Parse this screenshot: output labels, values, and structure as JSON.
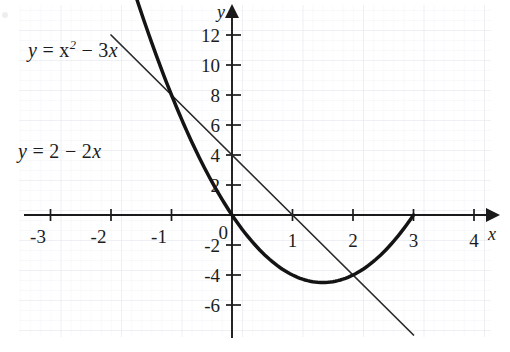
{
  "figure": {
    "kind": "cartesian-graph",
    "background": "#ffffff",
    "grid_color": "#e9ebf0",
    "grid_minor_color": "#f2f4f7",
    "ink_color": "#1a1a1a"
  },
  "axes": {
    "x_axis_label": "x",
    "y_axis_label": "y",
    "origin_label": "0",
    "x_ticks": [
      "-3",
      "-2",
      "-1",
      "1",
      "2",
      "3",
      "4"
    ],
    "y_ticks": [
      "12",
      "10",
      "8",
      "6",
      "4",
      "2",
      "-2",
      "-4",
      "-6"
    ],
    "x_range": [
      -3.7,
      4.3
    ],
    "y_range": [
      -7.0,
      13.0
    ],
    "x_unit_px": 60.5,
    "y_unit_px": 30.0,
    "origin_px": [
      232,
      215
    ]
  },
  "labels": {
    "parabola_prefix": "y",
    "parabola_eq": " = x",
    "parabola_sup": "2",
    "parabola_tail": " − 3",
    "parabola_var": "x",
    "line_prefix": "y",
    "line_eq": " = 2 − 2",
    "line_var": "x",
    "parabola_full": "y = x² − 3x",
    "line_full": "y = 2 − 2x"
  },
  "chart_data": {
    "type": "line",
    "title": "",
    "xlabel": "x",
    "ylabel": "y",
    "xlim": [
      -3.7,
      4.3
    ],
    "ylim": [
      -7.0,
      13.0
    ],
    "grid": true,
    "legend": "inline-annotations",
    "xticks": [
      -3,
      -2,
      -1,
      0,
      1,
      2,
      3,
      4
    ],
    "yticks": [
      -6,
      -4,
      -2,
      0,
      2,
      4,
      6,
      8,
      10,
      12
    ],
    "series": [
      {
        "name": "y = x² − 3x",
        "equation": "y = x^2 - 3x",
        "style": "thick-curve",
        "domain": [
          -2.0,
          3.0
        ],
        "x": [
          -2.0,
          -1.5,
          -1.0,
          -0.5,
          0.0,
          0.5,
          1.0,
          1.5,
          2.0,
          2.5,
          3.0
        ],
        "values": [
          10.0,
          6.75,
          4.0,
          1.75,
          0.0,
          -1.25,
          -2.0,
          -2.25,
          -2.0,
          -1.25,
          0.0
        ],
        "roots": [
          0,
          3
        ],
        "vertex": [
          1.5,
          -2.25
        ]
      },
      {
        "name": "y = 2 − 2x",
        "equation": "y = 2 - 2x",
        "style": "thin-line",
        "domain": [
          -2.0,
          3.0
        ],
        "x": [
          -2.0,
          3.0
        ],
        "values": [
          6.0,
          -4.0
        ],
        "y_intercept": 2,
        "x_intercept": 1
      }
    ],
    "intersections": [
      {
        "x": -1,
        "y": 4
      },
      {
        "x": 2,
        "y": -2
      }
    ],
    "annotations": [
      {
        "text": "y = x² − 3x",
        "at": [
          -2.9,
          11.0
        ]
      },
      {
        "text": "y = 2 − 2x",
        "at": [
          -3.3,
          4.5
        ]
      }
    ]
  }
}
